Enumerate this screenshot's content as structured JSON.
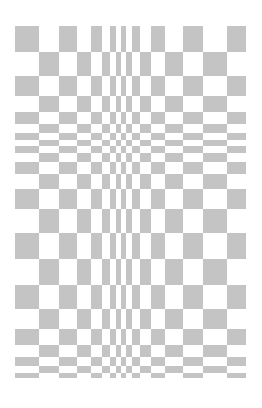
{
  "figure": {
    "colors": {
      "background": "#ffffff",
      "dark_square": "#c4c4c4",
      "light_square": "#ffffff"
    },
    "board": {
      "left": 15,
      "top": 26,
      "width": 231,
      "height": 352,
      "columns_px": [
        24,
        20,
        18,
        14,
        11,
        8,
        6,
        5,
        5,
        6,
        8,
        11,
        14,
        18,
        20,
        24,
        19
      ],
      "rows_px": [
        26,
        24,
        20,
        16,
        12,
        9,
        7,
        6,
        7,
        9,
        12,
        16,
        20,
        24,
        26,
        26,
        24,
        20,
        16,
        12,
        9,
        7,
        5
      ]
    }
  }
}
